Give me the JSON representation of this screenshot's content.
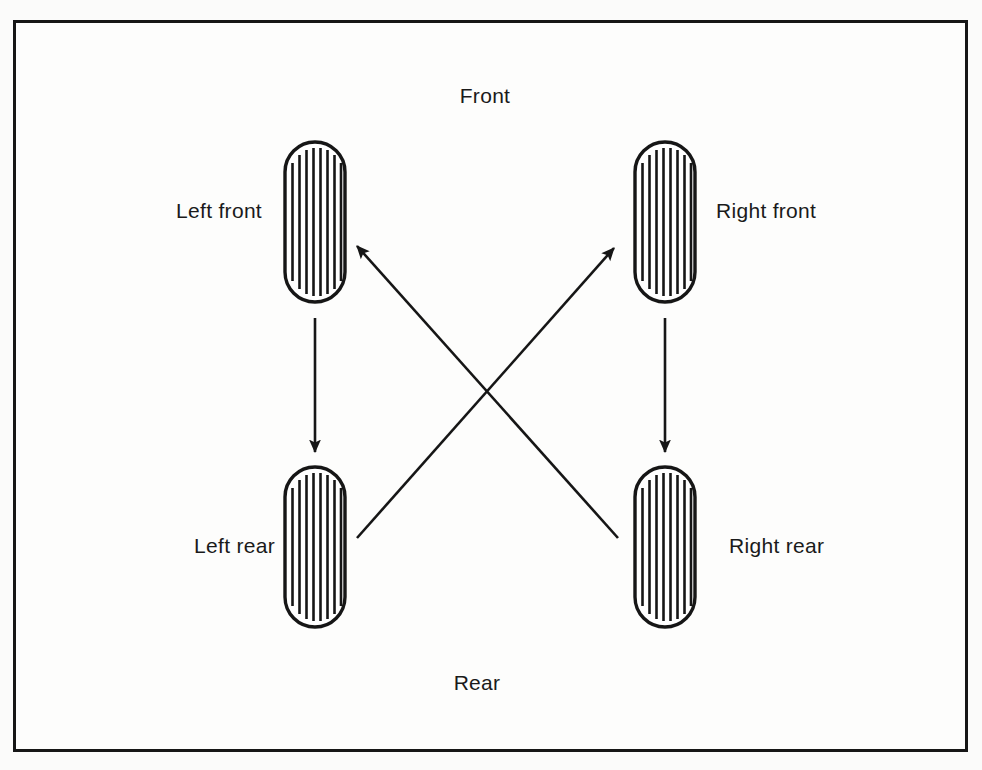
{
  "diagram": {
    "orientation_labels": {
      "front": "Front",
      "rear": "Rear"
    },
    "wheels": [
      {
        "id": "left-front",
        "label": "Left front",
        "x": 285,
        "y": 142,
        "width": 60,
        "height": 160,
        "tread_lines": 8
      },
      {
        "id": "right-front",
        "label": "Right front",
        "x": 635,
        "y": 142,
        "width": 60,
        "height": 160,
        "tread_lines": 8
      },
      {
        "id": "left-rear",
        "label": "Left rear",
        "x": 285,
        "y": 467,
        "width": 60,
        "height": 160,
        "tread_lines": 8
      },
      {
        "id": "right-rear",
        "label": "Right rear",
        "x": 635,
        "y": 467,
        "width": 60,
        "height": 160,
        "tread_lines": 8
      }
    ],
    "arrows": [
      {
        "id": "left-front-to-left-rear",
        "from": "left-front",
        "to": "left-rear",
        "x1": 315,
        "y1": 318,
        "x2": 315,
        "y2": 452
      },
      {
        "id": "right-front-to-right-rear",
        "from": "right-front",
        "to": "right-rear",
        "x1": 665,
        "y1": 318,
        "x2": 665,
        "y2": 452
      },
      {
        "id": "right-rear-to-left-front",
        "from": "right-rear",
        "to": "left-front",
        "x1": 618,
        "y1": 538,
        "x2": 355,
        "y2": 243
      },
      {
        "id": "left-rear-to-right-front",
        "from": "left-rear",
        "to": "right-front",
        "x1": 357,
        "y1": 538,
        "x2": 616,
        "y2": 245
      }
    ],
    "colors": {
      "ink": "#161616",
      "background": "#fdfdfc",
      "page_background": "#fbfbfa"
    }
  }
}
